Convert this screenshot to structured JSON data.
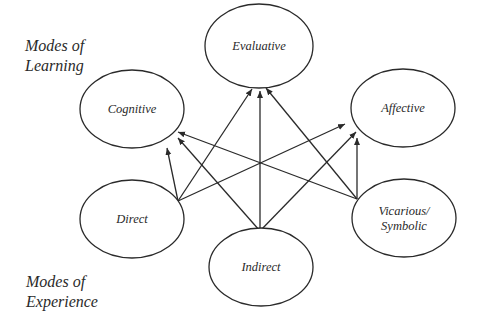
{
  "group_labels": {
    "learning": [
      "Modes of",
      "Learning"
    ],
    "experience": [
      "Modes of",
      "Experience"
    ]
  },
  "colors": {
    "stroke": "#2a2a2a",
    "background": "#ffffff"
  },
  "nodes": [
    {
      "id": "evaluative",
      "label": [
        "Evaluative"
      ],
      "group": "learning",
      "cx": 259,
      "cy": 46,
      "rx": 54,
      "ry": 42
    },
    {
      "id": "cognitive",
      "label": [
        "Cognitive"
      ],
      "group": "learning",
      "cx": 132,
      "cy": 109,
      "rx": 52,
      "ry": 39
    },
    {
      "id": "affective",
      "label": [
        "Affective"
      ],
      "group": "learning",
      "cx": 403,
      "cy": 108,
      "rx": 52,
      "ry": 39
    },
    {
      "id": "direct",
      "label": [
        "Direct"
      ],
      "group": "experience",
      "cx": 132,
      "cy": 219,
      "rx": 52,
      "ry": 39
    },
    {
      "id": "indirect",
      "label": [
        "Indirect"
      ],
      "group": "experience",
      "cx": 261,
      "cy": 267,
      "rx": 52,
      "ry": 39
    },
    {
      "id": "vicarious",
      "label": [
        "Vicarious/",
        "Symbolic"
      ],
      "group": "experience",
      "cx": 404,
      "cy": 218,
      "rx": 52,
      "ry": 39
    }
  ],
  "edges": [
    {
      "from": "direct",
      "to": "cognitive",
      "x1": 178,
      "y1": 201,
      "x2": 167,
      "y2": 148
    },
    {
      "from": "direct",
      "to": "evaluative",
      "x1": 178,
      "y1": 201,
      "x2": 252,
      "y2": 89
    },
    {
      "from": "direct",
      "to": "affective",
      "x1": 178,
      "y1": 201,
      "x2": 345,
      "y2": 124
    },
    {
      "from": "indirect",
      "to": "cognitive",
      "x1": 260,
      "y1": 231,
      "x2": 178,
      "y2": 138
    },
    {
      "from": "indirect",
      "to": "evaluative",
      "x1": 260,
      "y1": 231,
      "x2": 260,
      "y2": 91
    },
    {
      "from": "indirect",
      "to": "affective",
      "x1": 260,
      "y1": 231,
      "x2": 356,
      "y2": 132
    },
    {
      "from": "vicarious",
      "to": "cognitive",
      "x1": 357,
      "y1": 199,
      "x2": 178,
      "y2": 132
    },
    {
      "from": "vicarious",
      "to": "evaluative",
      "x1": 357,
      "y1": 199,
      "x2": 266,
      "y2": 88
    },
    {
      "from": "vicarious",
      "to": "affective",
      "x1": 357,
      "y1": 199,
      "x2": 357,
      "y2": 138
    }
  ]
}
